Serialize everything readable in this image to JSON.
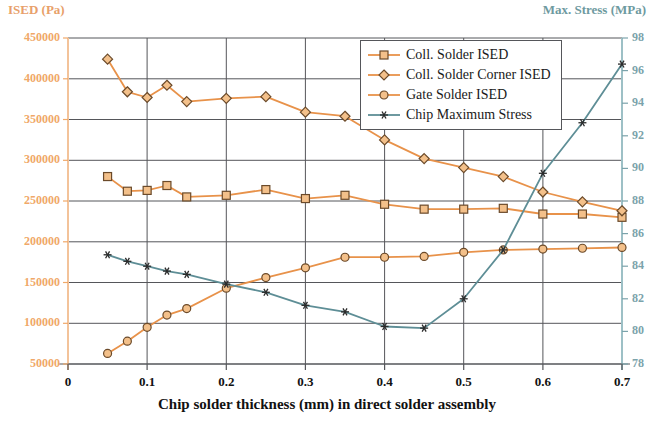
{
  "chart_data": {
    "type": "line",
    "title": "",
    "xlabel": "Chip solder thickness (mm) in direct solder assembly",
    "ylabel": "ISED (Pa)",
    "ylabel_secondary": "Max. Stress (MPa)",
    "grid": true,
    "legend_position": "top-right",
    "xlim": [
      0,
      0.7
    ],
    "ylim": [
      50000,
      450000
    ],
    "ylim_secondary": [
      78,
      98
    ],
    "xticks": [
      "0",
      "0.1",
      "0.2",
      "0.3",
      "0.4",
      "0.5",
      "0.6",
      "0.7"
    ],
    "xtick_values": [
      0,
      0.1,
      0.2,
      0.3,
      0.4,
      0.5,
      0.6,
      0.7
    ],
    "yticks": [
      "50000",
      "100000",
      "150000",
      "200000",
      "250000",
      "300000",
      "350000",
      "400000",
      "450000"
    ],
    "ytick_values": [
      50000,
      100000,
      150000,
      200000,
      250000,
      300000,
      350000,
      400000,
      450000
    ],
    "yticks_secondary": [
      "78",
      "80",
      "82",
      "84",
      "86",
      "88",
      "90",
      "92",
      "94",
      "96",
      "98"
    ],
    "ytick_values_secondary": [
      78,
      80,
      82,
      84,
      86,
      88,
      90,
      92,
      94,
      96,
      98
    ],
    "x": [
      0.05,
      0.075,
      0.1,
      0.125,
      0.15,
      0.2,
      0.25,
      0.3,
      0.35,
      0.4,
      0.45,
      0.5,
      0.55,
      0.6,
      0.65,
      0.7
    ],
    "series": [
      {
        "name": "Coll. Solder ISED",
        "axis": "left",
        "color": "#e8924a",
        "marker": "square",
        "values": [
          280000,
          262000,
          263000,
          269000,
          255000,
          257000,
          264000,
          253000,
          257000,
          246000,
          240000,
          240000,
          241000,
          234000,
          234000,
          230000
        ]
      },
      {
        "name": "Coll. Solder Corner ISED",
        "axis": "left",
        "color": "#e8924a",
        "marker": "diamond",
        "values": [
          424000,
          384000,
          377000,
          392000,
          372000,
          376000,
          378000,
          359000,
          354000,
          325000,
          302000,
          291000,
          280000,
          261000,
          249000,
          238000
        ]
      },
      {
        "name": "Gate Solder ISED",
        "axis": "left",
        "color": "#e8924a",
        "marker": "circle",
        "values": [
          63000,
          78000,
          95000,
          110000,
          118000,
          143000,
          156000,
          168000,
          181000,
          181000,
          182000,
          187000,
          190000,
          191000,
          192000,
          193000
        ]
      },
      {
        "name": "Chip Maximum Stress",
        "axis": "right",
        "color": "#5e8e96",
        "marker": "asterisk",
        "values": [
          84.7,
          84.3,
          84.0,
          83.7,
          83.5,
          82.9,
          82.4,
          81.6,
          81.2,
          80.3,
          80.2,
          82.0,
          85.0,
          89.7,
          92.8,
          96.4
        ]
      }
    ]
  },
  "legend": {
    "items": [
      {
        "label": "Coll. Solder ISED"
      },
      {
        "label": "Coll. Solder Corner ISED"
      },
      {
        "label": "Gate Solder ISED"
      },
      {
        "label": "Chip Maximum Stress"
      }
    ]
  }
}
